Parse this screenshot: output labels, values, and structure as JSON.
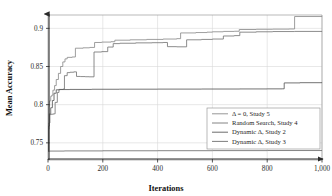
{
  "chart_data": {
    "type": "line",
    "title": "",
    "xlabel": "Iterations",
    "ylabel": "Mean Accuracy",
    "xlim": [
      0,
      1000
    ],
    "ylim": [
      0.7275,
      0.9175
    ],
    "grid": true,
    "legend_position": "lower-right",
    "xticks": [
      0,
      200,
      400,
      600,
      800,
      1000
    ],
    "xtick_labels": [
      "0",
      "200",
      "400",
      "600",
      "800",
      "1,000"
    ],
    "yticks": [
      0.75,
      0.8,
      0.85,
      0.9
    ],
    "ytick_labels": [
      "0.75",
      "0.8",
      "0.85",
      "0.9"
    ],
    "series": [
      {
        "name": "Δ = 0, Study 5",
        "color": "#8c8c8c",
        "points": [
          [
            0,
            0.74
          ],
          [
            2,
            0.768
          ],
          [
            4,
            0.798
          ],
          [
            6,
            0.805
          ],
          [
            10,
            0.811
          ],
          [
            14,
            0.8125
          ],
          [
            18,
            0.819
          ],
          [
            24,
            0.825
          ],
          [
            30,
            0.833
          ],
          [
            38,
            0.841
          ],
          [
            46,
            0.85
          ],
          [
            54,
            0.856
          ],
          [
            62,
            0.86
          ],
          [
            70,
            0.862
          ],
          [
            88,
            0.8625
          ],
          [
            100,
            0.874
          ],
          [
            128,
            0.8745
          ],
          [
            152,
            0.875
          ],
          [
            170,
            0.8815
          ],
          [
            196,
            0.882
          ],
          [
            230,
            0.8825
          ],
          [
            244,
            0.8845
          ],
          [
            300,
            0.885
          ],
          [
            360,
            0.8855
          ],
          [
            420,
            0.886
          ],
          [
            470,
            0.8865
          ],
          [
            484,
            0.894
          ],
          [
            540,
            0.8945
          ],
          [
            580,
            0.895
          ],
          [
            600,
            0.8955
          ],
          [
            640,
            0.896
          ],
          [
            680,
            0.8962
          ],
          [
            698,
            0.8985
          ],
          [
            760,
            0.8988
          ],
          [
            820,
            0.899
          ],
          [
            880,
            0.8992
          ],
          [
            900,
            0.9155
          ],
          [
            1000,
            0.9158
          ]
        ]
      },
      {
        "name": "Random Search, Study 4",
        "color": "#777777",
        "points": [
          [
            0,
            0.7395
          ],
          [
            3,
            0.776
          ],
          [
            7,
            0.787
          ],
          [
            12,
            0.7875
          ],
          [
            20,
            0.788
          ],
          [
            26,
            0.803
          ],
          [
            34,
            0.816
          ],
          [
            40,
            0.82
          ],
          [
            55,
            0.8205
          ],
          [
            60,
            0.838
          ],
          [
            70,
            0.842
          ],
          [
            80,
            0.8425
          ],
          [
            94,
            0.843
          ],
          [
            104,
            0.837
          ],
          [
            118,
            0.8368
          ],
          [
            136,
            0.8366
          ],
          [
            150,
            0.8365
          ],
          [
            168,
            0.869
          ],
          [
            196,
            0.8695
          ],
          [
            218,
            0.8755
          ],
          [
            238,
            0.88
          ],
          [
            262,
            0.8805
          ],
          [
            320,
            0.881
          ],
          [
            380,
            0.8812
          ],
          [
            420,
            0.8815
          ],
          [
            436,
            0.876
          ],
          [
            470,
            0.8758
          ],
          [
            506,
            0.885
          ],
          [
            560,
            0.8855
          ],
          [
            600,
            0.886
          ],
          [
            640,
            0.89
          ],
          [
            680,
            0.8905
          ],
          [
            700,
            0.895
          ],
          [
            760,
            0.8955
          ],
          [
            820,
            0.8958
          ],
          [
            900,
            0.896
          ],
          [
            1000,
            0.8962
          ]
        ]
      },
      {
        "name": "Dynamic Δ, Study 2",
        "color": "#5a5a5a",
        "points": [
          [
            0,
            0.739
          ],
          [
            2,
            0.772
          ],
          [
            5,
            0.788
          ],
          [
            10,
            0.796
          ],
          [
            16,
            0.8055
          ],
          [
            22,
            0.815
          ],
          [
            30,
            0.8195
          ],
          [
            44,
            0.8198
          ],
          [
            80,
            0.82
          ],
          [
            160,
            0.8202
          ],
          [
            260,
            0.8203
          ],
          [
            400,
            0.8204
          ],
          [
            560,
            0.8205
          ],
          [
            700,
            0.8206
          ],
          [
            800,
            0.8207
          ],
          [
            855,
            0.8208
          ],
          [
            862,
            0.8285
          ],
          [
            920,
            0.8288
          ],
          [
            1000,
            0.829
          ]
        ]
      },
      {
        "name": "Dynamic Δ, Study 3",
        "color": "#6e6e6e",
        "points": [
          [
            0,
            0.739
          ],
          [
            6,
            0.7392
          ],
          [
            60,
            0.7394
          ],
          [
            200,
            0.7396
          ],
          [
            400,
            0.7397
          ],
          [
            600,
            0.7398
          ],
          [
            800,
            0.7399
          ],
          [
            1000,
            0.74
          ]
        ]
      }
    ]
  },
  "axes": {
    "x_title": "Iterations",
    "y_title": "Mean Accuracy"
  },
  "legend": {
    "items": [
      {
        "label": "Δ = 0, Study 5"
      },
      {
        "label": "Random Search, Study 4"
      },
      {
        "label": "Dynamic Δ, Study 2"
      },
      {
        "label": "Dynamic Δ, Study 3"
      }
    ]
  }
}
